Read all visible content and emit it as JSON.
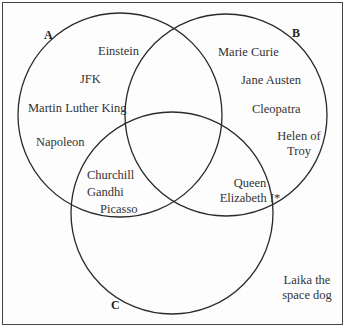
{
  "diagram": {
    "type": "venn",
    "sets": [
      {
        "id": "A",
        "label": "A"
      },
      {
        "id": "B",
        "label": "B"
      },
      {
        "id": "C",
        "label": "C"
      }
    ],
    "regions": {
      "A_only": [
        "Einstein",
        "JFK",
        "Martin Luther King",
        "Napoleon"
      ],
      "B_only": [
        "Marie Curie",
        "Jane Austen",
        "Cleopatra",
        "Helen of Troy"
      ],
      "A_and_C": [
        "Churchill",
        "Gandhi",
        "Picasso"
      ],
      "B_and_C": [
        "Queen Elizabeth I*"
      ],
      "outside": [
        "Laika the space dog"
      ]
    },
    "labels": {
      "einstein": "Einstein",
      "jfk": "JFK",
      "mlk": "Martin Luther King",
      "napoleon": "Napoleon",
      "curie": "Marie Curie",
      "austen": "Jane Austen",
      "cleopatra": "Cleopatra",
      "helen_1": "Helen of",
      "helen_2": "Troy",
      "churchill": "Churchill",
      "gandhi": "Gandhi",
      "picasso": "Picasso",
      "elizabeth_1": "Queen",
      "elizabeth_2": "Elizabeth I*",
      "laika_1": "Laika the",
      "laika_2": "space dog"
    },
    "stroke_color": "#2a2a2a"
  }
}
